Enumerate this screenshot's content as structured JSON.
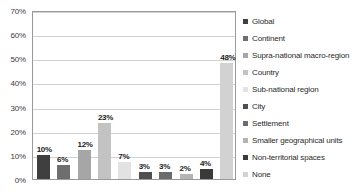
{
  "chart_data": {
    "type": "bar",
    "title": "",
    "subtitle": "",
    "xlabel": "",
    "ylabel": "",
    "ylim": [
      0,
      70
    ],
    "y_tick_labels": [
      "0%",
      "10%",
      "20%",
      "30%",
      "40%",
      "50%",
      "60%",
      "70%"
    ],
    "y_tick_values": [
      0,
      10,
      20,
      30,
      40,
      50,
      60,
      70
    ],
    "grid": true,
    "legend_position": "right",
    "categories": [
      "Global",
      "Continent",
      "Supra-national macro-region",
      "Country",
      "Sub-national region",
      "City",
      "Settlement",
      "Smaller geographical units",
      "Non-territorial spaces",
      "None"
    ],
    "values": [
      10,
      6,
      12,
      23,
      7,
      3,
      3,
      2,
      4,
      48
    ],
    "data_labels": [
      "10%",
      "6%",
      "12%",
      "23%",
      "7%",
      "3%",
      "3%",
      "2%",
      "4%",
      "48%"
    ],
    "colors": [
      "#3f3f3f",
      "#6e6e6e",
      "#a6a6a6",
      "#c3c3c3",
      "#e2e2e2",
      "#4f4f4f",
      "#6b6b6b",
      "#b4b4b4",
      "#3a3a3a",
      "#d2d2d2"
    ]
  },
  "legend": {
    "items": [
      {
        "label": "Global",
        "color": "#3f3f3f"
      },
      {
        "label": "Continent",
        "color": "#6e6e6e"
      },
      {
        "label": "Supra-national macro-region",
        "color": "#a6a6a6"
      },
      {
        "label": "Country",
        "color": "#c3c3c3"
      },
      {
        "label": "Sub-national region",
        "color": "#e2e2e2"
      },
      {
        "label": "City",
        "color": "#4f4f4f"
      },
      {
        "label": "Settlement",
        "color": "#6b6b6b"
      },
      {
        "label": "Smaller geographical units",
        "color": "#b4b4b4"
      },
      {
        "label": "Non-territorial spaces",
        "color": "#3a3a3a"
      },
      {
        "label": "None",
        "color": "#d2d2d2"
      }
    ]
  },
  "style": {
    "plot_border_color": "#9a9a9a",
    "gridline_color": "#d2d2d2",
    "background": "#ffffff",
    "label_text_color": "#1d1d1d"
  }
}
